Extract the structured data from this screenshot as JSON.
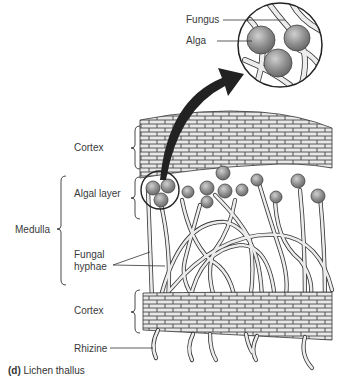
{
  "figure": {
    "caption_label": "(d)",
    "caption_text": "Lichen thallus"
  },
  "labels": {
    "fungus": "Fungus",
    "alga": "Alga",
    "cortex_upper": "Cortex",
    "algal_layer": "Algal layer",
    "medulla": "Medulla",
    "fungal_hyphae_line1": "Fungal",
    "fungal_hyphae_line2": "hyphae",
    "cortex_lower": "Cortex",
    "rhizine": "Rhizine"
  },
  "colors": {
    "cell_fill": "#e6e6e6",
    "outline": "#333333",
    "alga_fill": "#8c8c8c",
    "arrow": "#222222"
  }
}
